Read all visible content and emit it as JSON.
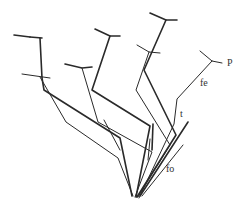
{
  "diagram": {
    "type": "branching phylogenetic-style tree",
    "background": "#ffffff",
    "stroke_color": "#2a2a2a",
    "root": {
      "x": 135,
      "y": 198
    },
    "labels": [
      {
        "id": "p",
        "text": "P",
        "x": 227,
        "y": 66
      },
      {
        "id": "fe",
        "text": "fe",
        "x": 200,
        "y": 86
      },
      {
        "id": "t",
        "text": "t",
        "x": 180,
        "y": 117
      },
      {
        "id": "fo",
        "text": "fo",
        "x": 166,
        "y": 172
      }
    ],
    "branches": [
      {
        "name": "far-left-upper",
        "weight": "thick",
        "points": [
          [
            40,
            38
          ],
          [
            42,
            78
          ],
          [
            44,
            90
          ],
          [
            120,
            138
          ],
          [
            132,
            196
          ]
        ]
      },
      {
        "name": "far-left-upper-tbar-left",
        "weight": "thick",
        "points": [
          [
            14,
            35
          ],
          [
            30,
            37
          ]
        ]
      },
      {
        "name": "far-left-upper-tbar-right",
        "weight": "thick",
        "points": [
          [
            30,
            37
          ],
          [
            42,
            38
          ]
        ]
      },
      {
        "name": "far-left-lower",
        "weight": "thin",
        "points": [
          [
            40,
            77
          ],
          [
            66,
            122
          ],
          [
            118,
            158
          ],
          [
            133,
            196
          ]
        ]
      },
      {
        "name": "far-left-lower-tbar",
        "weight": "thin",
        "points": [
          [
            22,
            74
          ],
          [
            50,
            78
          ]
        ]
      },
      {
        "name": "mid-left",
        "weight": "thin",
        "points": [
          [
            82,
            68
          ],
          [
            98,
            122
          ],
          [
            152,
            152
          ],
          [
            135,
            197
          ]
        ]
      },
      {
        "name": "mid-left-tbar",
        "weight": "thick",
        "points": [
          [
            65,
            64
          ],
          [
            82,
            68
          ],
          [
            92,
            67
          ]
        ]
      },
      {
        "name": "top-middle",
        "weight": "thick",
        "points": [
          [
            110,
            36
          ],
          [
            92,
            90
          ],
          [
            150,
            126
          ],
          [
            136,
            197
          ]
        ]
      },
      {
        "name": "top-middle-tbar",
        "weight": "thick",
        "points": [
          [
            95,
            29
          ],
          [
            110,
            36
          ],
          [
            120,
            36
          ]
        ]
      },
      {
        "name": "top-right",
        "weight": "thick",
        "points": [
          [
            166,
            20
          ],
          [
            144,
            70
          ],
          [
            176,
            135
          ],
          [
            137,
            197
          ]
        ]
      },
      {
        "name": "top-right-tbar",
        "weight": "thick",
        "points": [
          [
            150,
            13
          ],
          [
            166,
            20
          ],
          [
            177,
            20
          ]
        ]
      },
      {
        "name": "second-right",
        "weight": "thin",
        "points": [
          [
            149,
            52
          ],
          [
            136,
            90
          ],
          [
            170,
            145
          ],
          [
            138,
            197
          ]
        ]
      },
      {
        "name": "second-right-tbar",
        "weight": "thin",
        "points": [
          [
            137,
            45
          ],
          [
            149,
            52
          ],
          [
            160,
            53
          ]
        ]
      },
      {
        "name": "p-branch",
        "weight": "thin",
        "points": [
          [
            212,
            61
          ],
          [
            177,
            99
          ],
          [
            174,
            124
          ],
          [
            139,
            198
          ]
        ]
      },
      {
        "name": "p-tbar",
        "weight": "thin",
        "points": [
          [
            200,
            51
          ],
          [
            212,
            61
          ],
          [
            222,
            63
          ]
        ]
      },
      {
        "name": "t-spur",
        "weight": "thick",
        "points": [
          [
            188,
            122
          ],
          [
            140,
            196
          ]
        ]
      },
      {
        "name": "fo-spur",
        "weight": "thin",
        "points": [
          [
            183,
            145
          ],
          [
            142,
            196
          ]
        ]
      },
      {
        "name": "short-spur-a",
        "weight": "thick",
        "points": [
          [
            153,
            124
          ],
          [
            152,
            150
          ]
        ]
      },
      {
        "name": "short-spur-b",
        "weight": "thin",
        "points": [
          [
            150,
            139
          ],
          [
            148,
            160
          ]
        ]
      },
      {
        "name": "left-inner-spur",
        "weight": "thin",
        "points": [
          [
            104,
            120
          ],
          [
            120,
            150
          ]
        ]
      }
    ]
  }
}
